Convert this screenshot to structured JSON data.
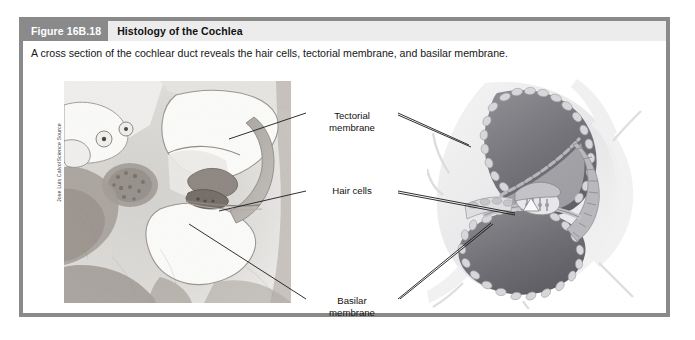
{
  "figure": {
    "number": "Figure 16B.18",
    "title": "Histology of the Cochlea",
    "caption": "A cross section of the cochlear duct reveals the hair cells, tectorial membrane, and basilar membrane.",
    "credit": "Jose Luis Calvo/Science Source"
  },
  "labels": {
    "tectorial_line1": "Tectorial",
    "tectorial_line2": "membrane",
    "hair_cells": "Hair cells",
    "basilar_line1": "Basilar",
    "basilar_line2": "membrane"
  },
  "colors": {
    "border": "#8a8a8a",
    "header_band": "#8a8a8a",
    "header_fill": "#ececec",
    "title_text": "#111111",
    "number_text": "#ffffff",
    "body_text": "#161616",
    "leader_line": "#1a1a1a",
    "photo_bg": "#f2f1ef",
    "illustration_dark": "#6e6e72",
    "illustration_mid": "#a8a8ad",
    "illustration_light": "#d8d8da"
  }
}
